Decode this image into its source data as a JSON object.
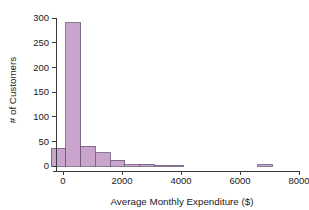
{
  "chart_data": {
    "type": "bar",
    "title": "",
    "subtitle": "",
    "xlabel": "Average Monthly Expenditure ($)",
    "ylabel": "# of Customers",
    "xlim": [
      -500,
      8200
    ],
    "ylim": [
      0,
      300
    ],
    "grid": false,
    "legend": null,
    "bin_width": 500,
    "bar_color": "#c9a4cc",
    "bar_edge_color": "#6b5a76",
    "axis_color": "#3a3a3a",
    "background_color": "#ffffff",
    "xticks": [
      0,
      2000,
      4000,
      6000,
      8000
    ],
    "xticklabels": [
      "0",
      "2000",
      "4000",
      "6000",
      "8000"
    ],
    "yticks": [
      0,
      50,
      100,
      150,
      200,
      250,
      300
    ],
    "yticklabels": [
      "0",
      "50",
      "100",
      "150",
      "200",
      "250",
      "300"
    ],
    "bins": [
      {
        "left": -400,
        "right": 100,
        "value": 36
      },
      {
        "left": 100,
        "right": 600,
        "value": 290
      },
      {
        "left": 600,
        "right": 1100,
        "value": 40
      },
      {
        "left": 1100,
        "right": 1600,
        "value": 27
      },
      {
        "left": 1600,
        "right": 2100,
        "value": 12
      },
      {
        "left": 2100,
        "right": 2600,
        "value": 3
      },
      {
        "left": 2600,
        "right": 3100,
        "value": 4
      },
      {
        "left": 3100,
        "right": 3600,
        "value": 2
      },
      {
        "left": 3600,
        "right": 4100,
        "value": 1
      },
      {
        "left": 4100,
        "right": 4600,
        "value": 0
      },
      {
        "left": 4600,
        "right": 5100,
        "value": 0
      },
      {
        "left": 5100,
        "right": 5600,
        "value": 0
      },
      {
        "left": 5600,
        "right": 6100,
        "value": 0
      },
      {
        "left": 6100,
        "right": 6600,
        "value": 0
      },
      {
        "left": 6600,
        "right": 7100,
        "value": 3
      },
      {
        "left": 7100,
        "right": 7600,
        "value": 0
      }
    ]
  },
  "labels": {
    "x_axis_title": "Average Monthly Expenditure ($)",
    "y_axis_title": "# of Customers"
  }
}
